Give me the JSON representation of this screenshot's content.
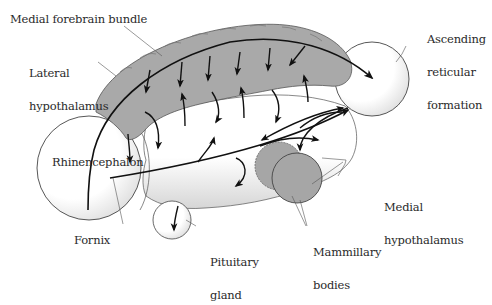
{
  "diagram": {
    "colors": {
      "bundle_fill": "#a9a9a9",
      "mammillary_fill": "#a6a6a6",
      "outline": "#333333",
      "arrow": "#111111",
      "leader": "#555555",
      "text": "#2a2a2a"
    },
    "labels": {
      "medial_forebrain_bundle": "Medial forebrain bundle",
      "lateral_hypothalamus": [
        "Lateral",
        "hypothalamus"
      ],
      "ascending_reticular_formation": [
        "Ascending",
        "reticular",
        "formation"
      ],
      "rhinencephalon": "Rhinencephalon",
      "medial_hypothalamus": [
        "Medial",
        "hypothalamus"
      ],
      "mammillary_bodies": [
        "Mammillary",
        "bodies"
      ],
      "fornix": "Fornix",
      "pituitary_gland": [
        "Pituitary",
        "gland"
      ]
    },
    "structures": [
      "medial-forebrain-bundle",
      "lateral-hypothalamus",
      "ascending-reticular-formation",
      "rhinencephalon",
      "medial-hypothalamus",
      "mammillary-bodies",
      "fornix",
      "pituitary-gland"
    ]
  }
}
